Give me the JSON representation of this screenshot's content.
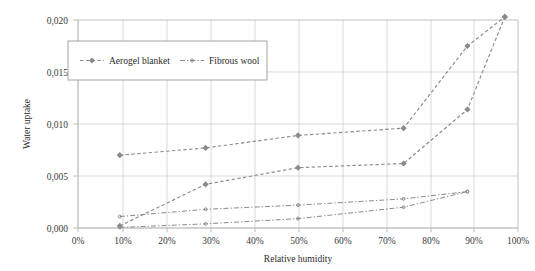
{
  "chart_data": {
    "type": "line",
    "title": "",
    "xlabel": "Relative humidity",
    "ylabel": "Water uptake",
    "xlim": [
      0,
      100
    ],
    "ylim": [
      0.0,
      0.02
    ],
    "grid": true,
    "legend_position": "top-left-inside",
    "x_tick_labels": [
      "0%",
      "10%",
      "20%",
      "30%",
      "40%",
      "50%",
      "60%",
      "70%",
      "80%",
      "90%",
      "100%"
    ],
    "x_ticks": [
      0,
      10,
      20,
      30,
      40,
      50,
      60,
      70,
      80,
      90,
      100
    ],
    "y_tick_labels": [
      "0,000",
      "0,005",
      "0,010",
      "0,015",
      "0,020"
    ],
    "y_ticks": [
      0.0,
      0.005,
      0.01,
      0.015,
      0.02
    ],
    "legend_entries": [
      "Aerogel blanket",
      "Fibrous wool"
    ],
    "series": [
      {
        "name": "Aerogel blanket",
        "style": "dashed",
        "marker": "diamond",
        "x": [
          9.5,
          29,
          50,
          74,
          88.5,
          97
        ],
        "values": [
          0.007,
          0.0077,
          0.0089,
          0.0096,
          0.0175,
          0.0203
        ]
      },
      {
        "name": "Aerogel blanket",
        "style": "dashed",
        "marker": "diamond",
        "x": [
          9.5,
          29,
          50,
          74,
          88.5,
          97
        ],
        "values": [
          0.0002,
          0.0042,
          0.0058,
          0.0062,
          0.0114,
          0.0203
        ]
      },
      {
        "name": "Fibrous wool",
        "style": "dashdot",
        "marker": "small",
        "x": [
          9.5,
          29,
          50,
          74,
          88.5
        ],
        "values": [
          0.0011,
          0.0018,
          0.0022,
          0.0028,
          0.0035
        ]
      },
      {
        "name": "Fibrous wool",
        "style": "dashdot",
        "marker": "small",
        "x": [
          9.5,
          29,
          50,
          74,
          88.5
        ],
        "values": [
          5e-05,
          0.0004,
          0.0009,
          0.002,
          0.0035
        ]
      }
    ]
  },
  "axes": {
    "ylabel": "Water uptake",
    "xlabel": "Relative humidity",
    "y_ticks": [
      "0,020",
      "0,015",
      "0,010",
      "0,005",
      "0,000"
    ],
    "x_ticks": [
      "0%",
      "10%",
      "20%",
      "30%",
      "40%",
      "50%",
      "60%",
      "70%",
      "80%",
      "90%",
      "100%"
    ]
  },
  "legend": {
    "entry_aerogel": "Aerogel blanket",
    "entry_fibrous": "Fibrous wool"
  },
  "colors": {
    "series": "#8b8b8b",
    "grid": "#c8c8c8",
    "text": "#2b2b2b",
    "legend_border": "#9a9a9a"
  }
}
